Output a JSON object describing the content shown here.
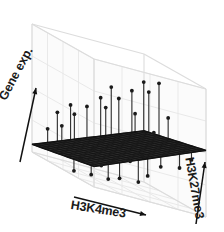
{
  "figure": {
    "type": "3d-surface-plot",
    "background_color": "#ffffff",
    "panel_color": "#fbfbfb",
    "grid_color": "#e6e6e6",
    "frame_color": "#dcdcdc",
    "surface_color": "#111111",
    "stick_color": "#333333",
    "marker_color": "#1a1a1a"
  },
  "axes": {
    "z": {
      "label": "Gene exp.",
      "arrow": "up-right",
      "name": "gene-expression-axis"
    },
    "x": {
      "label": "H3K4me3",
      "arrow": "right",
      "name": "h3k4me3-axis"
    },
    "y": {
      "label": "H3K27me3",
      "arrow": "up",
      "name": "h3k27me3-axis"
    }
  },
  "chart_data": {
    "type": "scatter",
    "title": "",
    "subtitle": "",
    "xlabel": "H3K4me3",
    "ylabel": "H3K27me3",
    "zlabel": "Gene exp.",
    "grid": true,
    "legend": null,
    "projection": "3d",
    "xlim": [
      0,
      1
    ],
    "ylim": [
      0,
      1
    ],
    "zlim": [
      0,
      1
    ],
    "tick_labels": {
      "x": [],
      "y": [],
      "z": []
    },
    "surface": {
      "description": "Fitted regression plane tilted upward toward high H3K4me3 and high H3K27me3 corner, rendered as a dark wireframe mesh",
      "nx": 22,
      "ny": 14,
      "z_corners": {
        "x0y0": 0.06,
        "x1y0": 0.4,
        "x0y1": 0.16,
        "x1y1": 0.52
      }
    },
    "points": [
      {
        "x": 0.04,
        "y": 0.18,
        "z": 0.24
      },
      {
        "x": 0.07,
        "y": 0.55,
        "z": 0.02
      },
      {
        "x": 0.1,
        "y": 0.3,
        "z": 0.31
      },
      {
        "x": 0.13,
        "y": 0.72,
        "z": 0.05
      },
      {
        "x": 0.16,
        "y": 0.12,
        "z": 0.38
      },
      {
        "x": 0.18,
        "y": 0.47,
        "z": 0.11
      },
      {
        "x": 0.21,
        "y": 0.85,
        "z": 0.07
      },
      {
        "x": 0.24,
        "y": 0.25,
        "z": 0.42
      },
      {
        "x": 0.27,
        "y": 0.63,
        "z": 0.13
      },
      {
        "x": 0.3,
        "y": 0.08,
        "z": 0.46
      },
      {
        "x": 0.33,
        "y": 0.4,
        "z": 0.21
      },
      {
        "x": 0.35,
        "y": 0.78,
        "z": 0.09
      },
      {
        "x": 0.38,
        "y": 0.2,
        "z": 0.5
      },
      {
        "x": 0.41,
        "y": 0.58,
        "z": 0.18
      },
      {
        "x": 0.44,
        "y": 0.92,
        "z": 0.12
      },
      {
        "x": 0.47,
        "y": 0.34,
        "z": 0.55
      },
      {
        "x": 0.5,
        "y": 0.68,
        "z": 0.23
      },
      {
        "x": 0.53,
        "y": 0.15,
        "z": 0.59
      },
      {
        "x": 0.56,
        "y": 0.45,
        "z": 0.33
      },
      {
        "x": 0.59,
        "y": 0.8,
        "z": 0.17
      },
      {
        "x": 0.62,
        "y": 0.28,
        "z": 0.64
      },
      {
        "x": 0.65,
        "y": 0.6,
        "z": 0.29
      },
      {
        "x": 0.68,
        "y": 0.05,
        "z": 0.68
      },
      {
        "x": 0.71,
        "y": 0.38,
        "z": 0.57
      },
      {
        "x": 0.74,
        "y": 0.74,
        "z": 0.26
      },
      {
        "x": 0.77,
        "y": 0.22,
        "z": 0.72
      },
      {
        "x": 0.8,
        "y": 0.52,
        "z": 0.48
      },
      {
        "x": 0.83,
        "y": 0.88,
        "z": 0.31
      },
      {
        "x": 0.86,
        "y": 0.33,
        "z": 0.76
      },
      {
        "x": 0.89,
        "y": 0.66,
        "z": 0.44
      },
      {
        "x": 0.92,
        "y": 0.14,
        "z": 0.8
      },
      {
        "x": 0.95,
        "y": 0.48,
        "z": 0.62
      },
      {
        "x": 0.97,
        "y": 0.82,
        "z": 0.39
      },
      {
        "x": 0.99,
        "y": 0.26,
        "z": 0.84
      }
    ]
  }
}
